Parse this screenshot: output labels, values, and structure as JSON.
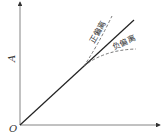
{
  "diagram": {
    "y_axis_label": "A",
    "origin_label": "O",
    "positive_deviation_label": "正偏离",
    "negative_deviation_label": "负偏离",
    "colors": {
      "line": "#222222",
      "dashed": "#555555",
      "text": "#333333"
    }
  }
}
